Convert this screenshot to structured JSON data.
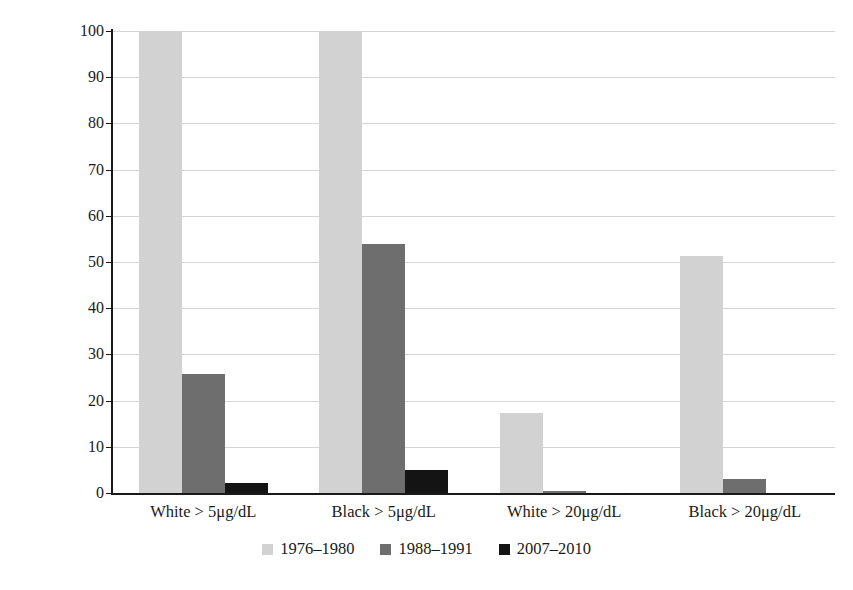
{
  "chart_data": {
    "type": "bar",
    "title": "",
    "xlabel": "",
    "ylabel": "% of U.S. children under age five",
    "ylim": [
      0,
      100
    ],
    "ytick_labels": [
      "100",
      "90",
      "80",
      "70",
      "60",
      "50",
      "40",
      "30",
      "20",
      "10",
      "0"
    ],
    "ytick_values": [
      100,
      90,
      80,
      70,
      60,
      50,
      40,
      30,
      20,
      10,
      0
    ],
    "grid": true,
    "grid_axis": "y",
    "legend_position": "bottom-center",
    "categories": [
      "White > 5μg/dL",
      "Black > 5μg/dL",
      "White > 20μg/dL",
      "Black > 20μg/dL"
    ],
    "series": [
      {
        "name": "1976–1980",
        "color": "#d2d2d2",
        "values": [
          100,
          100,
          17.3,
          51.2
        ]
      },
      {
        "name": "1988–1991",
        "color": "#6e6e6e",
        "values": [
          25.8,
          53.8,
          0.5,
          3.1
        ]
      },
      {
        "name": "2007–2010",
        "color": "#141414",
        "values": [
          2.2,
          5.0,
          0.1,
          0.0
        ]
      }
    ]
  },
  "axes": {
    "y_title": "% of U.S. children under age five"
  }
}
